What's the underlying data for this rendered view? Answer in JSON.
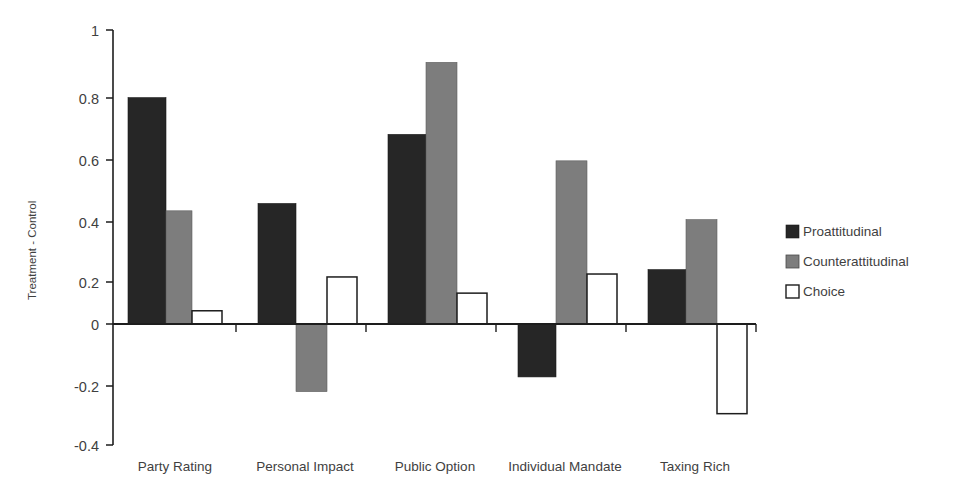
{
  "chart_data": {
    "type": "bar",
    "title": "",
    "subtitle": "",
    "xlabel": "",
    "ylabel": "Treatment - Control",
    "categories": [
      "Party Rating",
      "Personal Impact",
      "Public Option",
      "Individual Mandate",
      "Taxing Rich"
    ],
    "series": [
      {
        "name": "Proattitudinal",
        "color": "#262626",
        "values": [
          0.77,
          0.41,
          0.645,
          -0.18,
          0.185
        ]
      },
      {
        "name": "Counterattitudinal",
        "color": "#7d7d7d",
        "values": [
          0.385,
          -0.23,
          0.89,
          0.555,
          0.355
        ]
      },
      {
        "name": "Choice",
        "color": "#ffffff",
        "values": [
          0.045,
          0.16,
          0.105,
          0.17,
          -0.305
        ]
      }
    ],
    "ylim": [
      -0.4,
      1.0
    ],
    "ytick_values": [
      1,
      0.8,
      0.6,
      0.4,
      0.2,
      0,
      -0.2,
      -0.4
    ],
    "ytick_labels": [
      "1",
      "0.8",
      "0.6",
      "0.4",
      "0.2",
      "0",
      "-0.2",
      "-0.4"
    ],
    "grid": false,
    "legend_position": "right",
    "legend_entries": [
      "Proattitudinal",
      "Counterattitudinal",
      "Choice"
    ]
  },
  "axis": {
    "y_title": "Treatment - Control"
  },
  "legend": {
    "items": [
      {
        "label": "Proattitudinal"
      },
      {
        "label": "Counterattitudinal"
      },
      {
        "label": "Choice"
      }
    ]
  }
}
